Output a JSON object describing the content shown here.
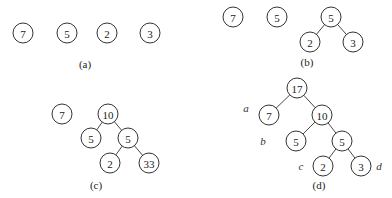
{
  "figure": {
    "panels": [
      {
        "id": "a",
        "caption": "(a)",
        "caption_pos": [
          85,
          68
        ],
        "nodes": [
          {
            "label": "7",
            "x": 23,
            "y": 33
          },
          {
            "label": "5",
            "x": 67,
            "y": 33
          },
          {
            "label": "2",
            "x": 107,
            "y": 33
          },
          {
            "label": "3",
            "x": 150,
            "y": 33
          }
        ],
        "edges": []
      },
      {
        "id": "b",
        "caption": "(b)",
        "caption_pos": [
          307,
          66
        ],
        "nodes": [
          {
            "label": "7",
            "x": 233,
            "y": 17
          },
          {
            "label": "5",
            "x": 277,
            "y": 17
          },
          {
            "label": "5",
            "x": 331,
            "y": 17
          },
          {
            "label": "2",
            "x": 310,
            "y": 42
          },
          {
            "label": "3",
            "x": 353,
            "y": 42
          }
        ],
        "edges": [
          [
            2,
            3
          ],
          [
            2,
            4
          ]
        ]
      },
      {
        "id": "c",
        "caption": "(c)",
        "caption_pos": [
          96,
          189
        ],
        "nodes": [
          {
            "label": "7",
            "x": 62,
            "y": 114
          },
          {
            "label": "10",
            "x": 108,
            "y": 114
          },
          {
            "label": "5",
            "x": 91,
            "y": 138
          },
          {
            "label": "5",
            "x": 128,
            "y": 138
          },
          {
            "label": "2",
            "x": 110,
            "y": 163
          },
          {
            "label": "33",
            "x": 149,
            "y": 163
          }
        ],
        "edges": [
          [
            1,
            2
          ],
          [
            1,
            3
          ],
          [
            3,
            4
          ],
          [
            3,
            5
          ]
        ]
      },
      {
        "id": "d",
        "caption": "(d)",
        "caption_pos": [
          319,
          189
        ],
        "nodes": [
          {
            "label": "17",
            "x": 297,
            "y": 88
          },
          {
            "label": "7",
            "x": 269,
            "y": 115
          },
          {
            "label": "10",
            "x": 322,
            "y": 115
          },
          {
            "label": "5",
            "x": 296,
            "y": 141
          },
          {
            "label": "5",
            "x": 342,
            "y": 141
          },
          {
            "label": "2",
            "x": 323,
            "y": 166
          },
          {
            "label": "3",
            "x": 361,
            "y": 166
          }
        ],
        "edges": [
          [
            0,
            1
          ],
          [
            0,
            2
          ],
          [
            2,
            3
          ],
          [
            2,
            4
          ],
          [
            4,
            5
          ],
          [
            4,
            6
          ]
        ],
        "annotations": [
          {
            "label": "a",
            "x": 246,
            "y": 108
          },
          {
            "label": "b",
            "x": 263,
            "y": 141
          },
          {
            "label": "c",
            "x": 301,
            "y": 166
          },
          {
            "label": "d",
            "x": 379,
            "y": 166
          }
        ]
      }
    ],
    "node_radius": 10
  }
}
